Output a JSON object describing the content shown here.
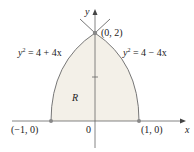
{
  "diagram": {
    "axes": {
      "x_label": "x",
      "y_label": "y",
      "origin_label": "0"
    },
    "curves": [
      {
        "name": "left-parabola",
        "eq_lhs": "y",
        "eq_exp": "2",
        "eq_rhs": " = 4 + 4x"
      },
      {
        "name": "right-parabola",
        "eq_lhs": "y",
        "eq_exp": "2",
        "eq_rhs": " = 4 − 4x"
      }
    ],
    "points": [
      {
        "label": "(0, 2)"
      },
      {
        "label": "(−1, 0)"
      },
      {
        "label": "(1, 0)"
      }
    ],
    "region_label": "R",
    "colors": {
      "fill": "#f1eee6",
      "curve": "#777777",
      "point": "#888888"
    }
  }
}
